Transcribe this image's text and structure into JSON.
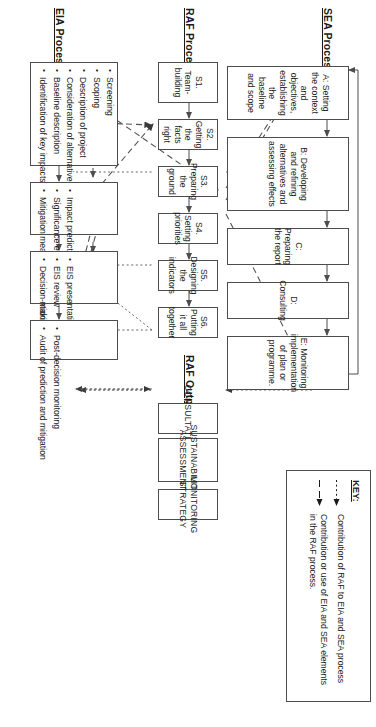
{
  "diagram": {
    "orientation": "rotated-90-clockwise"
  },
  "bands": {
    "sea": {
      "title": "SEA Process"
    },
    "raf": {
      "title": "RAF Process"
    },
    "raf_outputs": {
      "title": "RAF Outputs"
    },
    "eia": {
      "title": "EIA Process"
    }
  },
  "sea_steps": [
    {
      "label": "A: Setting the context and objectives, establishing the baseline and scope"
    },
    {
      "label": "B: Developing and refining alternatives and assessing effects"
    },
    {
      "label": "C: Preparing the report"
    },
    {
      "label": "D: Consulting"
    },
    {
      "label": "E: Monitoring implementation of plan or programme."
    }
  ],
  "raf_steps": [
    {
      "label": "S1. Team-building"
    },
    {
      "label": "S2. Getting the facts right"
    },
    {
      "label": "S3. Preparing the ground"
    },
    {
      "label": "S4. Setting priorities"
    },
    {
      "label": "S5. Designing the indicators"
    },
    {
      "label": "S6. Putting it all together"
    }
  ],
  "raf_output_boxes": [
    {
      "label": "CONSULTATION"
    },
    {
      "label": "SUSTAINABILITY ASSESSMENT"
    },
    {
      "label": "MONITORING STRATEGY"
    }
  ],
  "eia_groups": [
    {
      "items": [
        "Screening",
        "Scoping",
        "Description of project",
        "Consideration of alternatives",
        "Baseline description",
        "Identification of key impacts"
      ]
    },
    {
      "items": [
        "Impact prediction",
        "Significance evaluation",
        "Mitigation measure identification"
      ]
    },
    {
      "items": [
        "EIS presentation",
        "EIS review",
        "Decision-making"
      ]
    },
    {
      "items": [
        "Post-decision monitoring",
        "Audit of prediction and mitigation"
      ]
    }
  ],
  "key": {
    "title": "KEY:",
    "entries": [
      {
        "style": "dotted",
        "text": "Contribution of RAF to EIA and SEA process"
      },
      {
        "style": "dashed",
        "text": "Contribution or use of EIA and SEA elements in the RAF process."
      }
    ]
  },
  "colors": {
    "box_border": "#4d4d4d",
    "line": "#555555",
    "background": "#ffffff",
    "text": "#1a1a1a"
  }
}
